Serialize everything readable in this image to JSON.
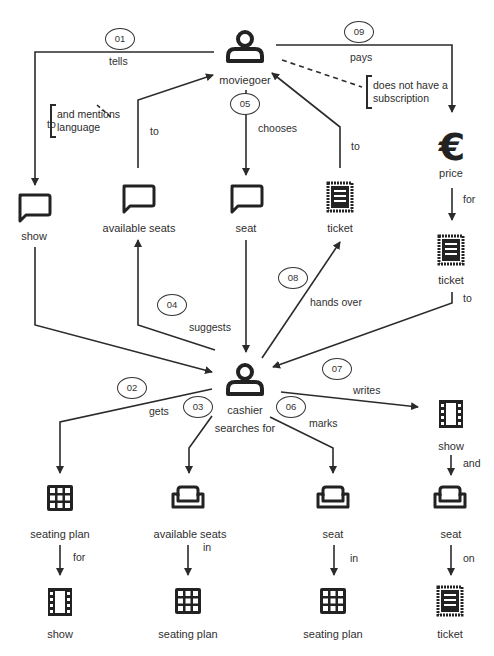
{
  "diagram": {
    "type": "process-concept-map",
    "nodes": {
      "moviegoer": {
        "label": "moviegoer",
        "icon": "person-icon"
      },
      "cashier": {
        "label": "cashier",
        "icon": "person-icon"
      },
      "show_msg": {
        "label": "show",
        "icon": "speech-bubble-icon"
      },
      "available_seats_msg": {
        "label": "available seats",
        "icon": "speech-bubble-icon"
      },
      "seat_msg": {
        "label": "seat",
        "icon": "speech-bubble-icon"
      },
      "ticket_top": {
        "label": "ticket",
        "icon": "ticket-icon"
      },
      "price": {
        "label": "price",
        "icon": "euro-icon"
      },
      "ticket_right": {
        "label": "ticket",
        "icon": "ticket-icon"
      },
      "seating_plan_1": {
        "label": "seating plan",
        "icon": "grid-icon"
      },
      "show_1": {
        "label": "show",
        "icon": "film-icon"
      },
      "available_seats_2": {
        "label": "available seats",
        "icon": "sofa-icon"
      },
      "seating_plan_2": {
        "label": "seating plan",
        "icon": "grid-icon"
      },
      "seat_2": {
        "label": "seat",
        "icon": "sofa-icon"
      },
      "seating_plan_3": {
        "label": "seating plan",
        "icon": "grid-icon"
      },
      "show_2": {
        "label": "show",
        "icon": "film-icon"
      },
      "seat_3": {
        "label": "seat",
        "icon": "sofa-icon"
      },
      "ticket_bottom": {
        "label": "ticket",
        "icon": "ticket-icon"
      }
    },
    "steps": [
      {
        "num": "01",
        "verb": "tells",
        "to": "to"
      },
      {
        "num": "02",
        "verb": "gets",
        "to": "for"
      },
      {
        "num": "03",
        "verb": "searches for",
        "to": "in"
      },
      {
        "num": "04",
        "verb": "suggests",
        "to": "to"
      },
      {
        "num": "05",
        "verb": "chooses",
        "to": "to"
      },
      {
        "num": "06",
        "verb": "marks",
        "to": "in"
      },
      {
        "num": "07",
        "verb": "writes",
        "to": "and",
        "extra": "on"
      },
      {
        "num": "08",
        "verb": "hands over",
        "to": "to"
      },
      {
        "num": "09",
        "verb": "pays",
        "to": "for",
        "extra": "to"
      }
    ],
    "notes": {
      "language": "and mentions\nlanguage",
      "subscription": "does not have a\nsubscription"
    }
  }
}
